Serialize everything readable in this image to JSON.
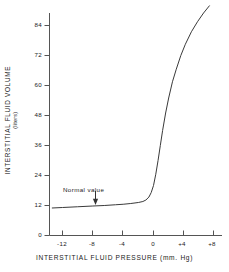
{
  "chart_data": {
    "type": "line",
    "title": "",
    "xlabel": "INTERSTITIAL  FLUID  PRESSURE  (mm. Hg)",
    "ylabel": "INTERSTITIAL  FLUID  VOLUME",
    "ylabel_unit": "(liters)",
    "xlim": [
      -13.5,
      8.0
    ],
    "ylim": [
      0,
      92
    ],
    "xticks": [
      -12,
      -8,
      -4,
      0,
      4,
      8
    ],
    "xtick_labels": [
      "-12",
      "-8",
      "-4",
      "0",
      "+4",
      "+8"
    ],
    "yticks": [
      0,
      12,
      24,
      36,
      48,
      60,
      72,
      84
    ],
    "ytick_labels": [
      "0",
      "12",
      "24",
      "36",
      "48",
      "60",
      "72",
      "84"
    ],
    "grid": false,
    "legend": "none",
    "line_color": "#3a3a3a",
    "axis_color": "#555555",
    "series": [
      {
        "name": "Interstitial fluid volume vs pressure",
        "x": [
          -13.4,
          -12.0,
          -10.0,
          -8.0,
          -6.5,
          -5.0,
          -4.0,
          -3.0,
          -2.0,
          -1.4,
          -1.0,
          -0.6,
          -0.3,
          0.0,
          0.3,
          0.6,
          0.9,
          1.2,
          1.6,
          2.0,
          2.5,
          3.0,
          3.6,
          4.2,
          5.0,
          5.8,
          6.6,
          7.4
        ],
        "y": [
          11.0,
          11.2,
          11.5,
          11.8,
          12.0,
          12.3,
          12.5,
          12.8,
          13.2,
          13.6,
          14.2,
          15.4,
          17.2,
          20.0,
          24.5,
          30.0,
          36.0,
          42.0,
          49.0,
          55.0,
          61.5,
          66.5,
          72.0,
          76.5,
          81.5,
          85.5,
          89.0,
          92.0
        ]
      }
    ],
    "annotations": [
      {
        "text": "Normal  value",
        "marker": "down-arrow",
        "x": -6.5,
        "y": 12.0
      }
    ]
  }
}
